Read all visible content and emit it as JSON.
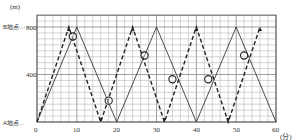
{
  "chart_data": {
    "type": "line",
    "title": "",
    "xlabel": "(分)",
    "ylabel": "(m)",
    "xlim": [
      0,
      60
    ],
    "ylim": [
      0,
      900
    ],
    "x_ticks": [
      0,
      10,
      20,
      30,
      40,
      50,
      60
    ],
    "y_ticks": [
      400,
      800
    ],
    "grid": true,
    "y_annotations": [
      {
        "label": "B地点",
        "value": 800
      },
      {
        "label": "A地点",
        "value": 0
      }
    ],
    "series": [
      {
        "name": "solid",
        "style": "solid",
        "x": [
          0,
          10,
          20,
          30,
          40,
          50,
          60
        ],
        "y": [
          0,
          800,
          0,
          800,
          0,
          800,
          0
        ]
      },
      {
        "name": "dashed",
        "style": "dashed",
        "x": [
          0,
          8,
          16,
          24,
          32,
          40,
          48,
          56
        ],
        "y": [
          0,
          800,
          0,
          800,
          0,
          800,
          0,
          800
        ]
      }
    ],
    "markers": [
      {
        "x": 9,
        "y": 720
      },
      {
        "x": 18,
        "y": 180
      },
      {
        "x": 27,
        "y": 560
      },
      {
        "x": 34,
        "y": 360
      },
      {
        "x": 43,
        "y": 360
      },
      {
        "x": 52,
        "y": 560
      }
    ]
  },
  "labels": {
    "y_unit": "(m)",
    "x_unit": "(分)",
    "b_point": "B地点…",
    "a_point": "A地点…",
    "y800": "800",
    "y400": "400",
    "x0": "0",
    "x10": "10",
    "x20": "20",
    "x30": "30",
    "x40": "40",
    "x50": "50",
    "x60": "60"
  }
}
